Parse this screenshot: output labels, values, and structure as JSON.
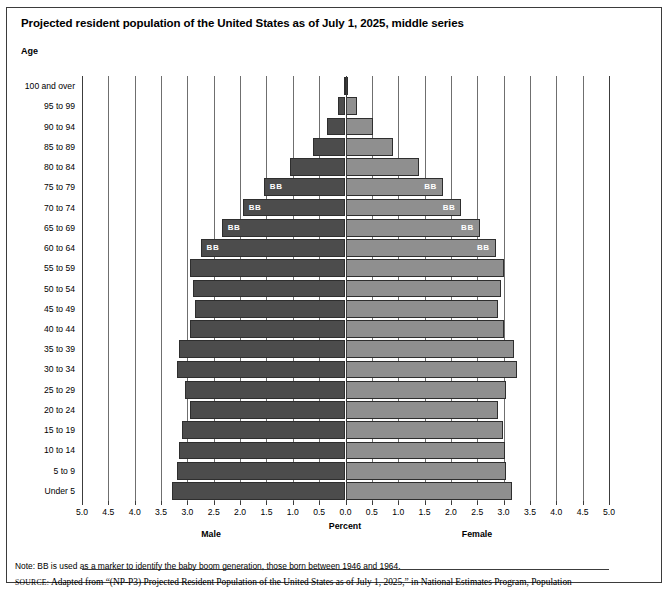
{
  "title": "Projected resident population of the United States as of July 1, 2025, middle series",
  "age_axis_label": "Age",
  "captions": {
    "male": "Male",
    "percent": "Percent",
    "female": "Female"
  },
  "note": "Note: BB is used as a marker to identify the baby boom generation, those born between 1946 and 1964.",
  "source_label": "source:",
  "source_text": "Adapted from “(NP-P3) Projected Resident Population of the United States as of July 1, 2025,” in National Estimates Program, Population",
  "source_text_2": "Division, U.S. Census Bureau, 2000, http://www.census.gov/population/www/projections/natsum-T3.html (accessed March 24, 2004)",
  "colors": {
    "male_bar": "#4c4c4c",
    "female_bar": "#8f8f8f",
    "gridline": "#6f6f6f",
    "axis": "#3c3c3c",
    "bb_text": "#ffffff"
  },
  "bb_marker": "BB",
  "chart_data": {
    "type": "bar",
    "subtype": "population-pyramid",
    "title": "Projected resident population of the United States as of July 1, 2025, middle series",
    "xlabel": "Percent",
    "ylabel": "Age",
    "xlim": [
      -5.0,
      5.0
    ],
    "xticks": [
      5.0,
      4.5,
      4.0,
      3.5,
      3.0,
      2.5,
      2.0,
      1.5,
      1.0,
      0.5,
      0.0,
      0.5,
      1.0,
      1.5,
      2.0,
      2.5,
      3.0,
      3.5,
      4.0,
      4.5,
      5.0
    ],
    "grid": true,
    "legend": [
      "Male",
      "Female"
    ],
    "legend_position": "below-axis",
    "categories": [
      "100 and over",
      "95 to 99",
      "90 to 94",
      "85 to 89",
      "80 to 84",
      "75 to 79",
      "70 to 74",
      "65 to 69",
      "60 to 64",
      "55 to 59",
      "50 to 54",
      "45 to 49",
      "40 to 44",
      "35 to 39",
      "30 to 34",
      "25 to 29",
      "20 to 24",
      "15 to 19",
      "10 to 14",
      "5 to 9",
      "Under 5"
    ],
    "series": [
      {
        "name": "Male",
        "side": "left",
        "values": [
          0.03,
          0.14,
          0.35,
          0.62,
          1.05,
          1.55,
          1.95,
          2.35,
          2.75,
          2.95,
          2.9,
          2.85,
          2.95,
          3.15,
          3.2,
          3.05,
          2.95,
          3.1,
          3.15,
          3.2,
          3.3
        ]
      },
      {
        "name": "Female",
        "side": "right",
        "values": [
          0.03,
          0.22,
          0.52,
          0.9,
          1.4,
          1.85,
          2.2,
          2.55,
          2.85,
          3.0,
          2.95,
          2.9,
          3.0,
          3.2,
          3.25,
          3.05,
          2.9,
          2.98,
          3.02,
          3.05,
          3.15
        ]
      }
    ],
    "bb_rows": [
      "75 to 79",
      "70 to 74",
      "65 to 69",
      "60 to 64"
    ],
    "bb_note": "BB is used as a marker to identify the baby boom generation, those born between 1946 and 1964."
  }
}
